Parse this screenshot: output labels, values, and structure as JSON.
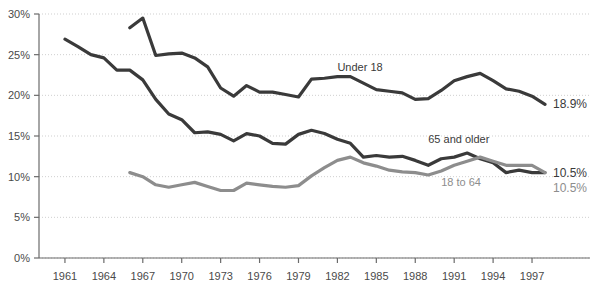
{
  "chart_data": {
    "type": "line",
    "title": "",
    "xlabel": "",
    "ylabel": "",
    "xlim": [
      1959,
      1998
    ],
    "ylim": [
      0,
      30
    ],
    "grid": true,
    "grid_style": "dotted-horizontal",
    "legend_position": "inline-annotations",
    "y_ticks": [
      "0%",
      "5%",
      "10%",
      "15%",
      "20%",
      "25%",
      "30%"
    ],
    "y_tick_values": [
      0,
      5,
      10,
      15,
      20,
      25,
      30
    ],
    "x_ticks": [
      "1961",
      "1964",
      "1967",
      "1970",
      "1973",
      "1976",
      "1979",
      "1982",
      "1985",
      "1988",
      "1991",
      "1994",
      "1997"
    ],
    "x_tick_values": [
      1961,
      1964,
      1967,
      1970,
      1973,
      1976,
      1979,
      1982,
      1985,
      1988,
      1991,
      1994,
      1997
    ],
    "series": [
      {
        "name": "Under 18",
        "label": "Under 18",
        "color": "#3a3a3a",
        "end_value_label": "18.9%",
        "end_value": 18.9,
        "x": [
          1966,
          1967,
          1968,
          1969,
          1970,
          1971,
          1972,
          1973,
          1974,
          1975,
          1976,
          1977,
          1978,
          1979,
          1980,
          1981,
          1982,
          1983,
          1984,
          1985,
          1986,
          1987,
          1988,
          1989,
          1990,
          1991,
          1992,
          1993,
          1994,
          1995,
          1996,
          1997,
          1998
        ],
        "values": [
          28.3,
          29.5,
          24.9,
          25.1,
          25.2,
          24.6,
          23.5,
          20.9,
          19.9,
          21.2,
          20.4,
          20.4,
          20.1,
          19.8,
          22.0,
          22.1,
          22.3,
          22.3,
          21.5,
          20.7,
          20.5,
          20.3,
          19.5,
          19.6,
          20.6,
          21.8,
          22.3,
          22.7,
          21.8,
          20.8,
          20.5,
          19.9,
          18.9
        ]
      },
      {
        "name": "65 and older",
        "label": "65 and older",
        "color": "#3a3a3a",
        "end_value_label": "10.5%",
        "end_value": 10.5,
        "x": [
          1961,
          1962,
          1963,
          1964,
          1965,
          1966,
          1967,
          1968,
          1969,
          1970,
          1971,
          1972,
          1973,
          1974,
          1975,
          1976,
          1977,
          1978,
          1979,
          1980,
          1981,
          1982,
          1983,
          1984,
          1985,
          1986,
          1987,
          1988,
          1989,
          1990,
          1991,
          1992,
          1993,
          1994,
          1995,
          1996,
          1997,
          1998
        ],
        "values": [
          26.9,
          26.0,
          25.0,
          24.6,
          23.1,
          23.1,
          21.9,
          19.5,
          17.7,
          17.0,
          15.4,
          15.5,
          15.2,
          14.4,
          15.3,
          15.0,
          14.1,
          14.0,
          15.2,
          15.7,
          15.3,
          14.6,
          14.1,
          12.4,
          12.6,
          12.4,
          12.5,
          12.0,
          11.4,
          12.2,
          12.4,
          12.9,
          12.2,
          11.7,
          10.5,
          10.8,
          10.5,
          10.5
        ]
      },
      {
        "name": "18 to 64",
        "label": "18 to 64",
        "color": "#8d8d8d",
        "end_value_label": "10.5%",
        "end_value": 10.5,
        "x": [
          1966,
          1967,
          1968,
          1969,
          1970,
          1971,
          1972,
          1973,
          1974,
          1975,
          1976,
          1977,
          1978,
          1979,
          1980,
          1981,
          1982,
          1983,
          1984,
          1985,
          1986,
          1987,
          1988,
          1989,
          1990,
          1991,
          1992,
          1993,
          1994,
          1995,
          1996,
          1997,
          1998
        ],
        "values": [
          10.5,
          10.0,
          9.0,
          8.7,
          9.0,
          9.3,
          8.8,
          8.3,
          8.3,
          9.2,
          9.0,
          8.8,
          8.7,
          8.9,
          10.1,
          11.1,
          12.0,
          12.4,
          11.7,
          11.3,
          10.8,
          10.6,
          10.5,
          10.2,
          10.7,
          11.4,
          11.9,
          12.4,
          11.9,
          11.4,
          11.4,
          11.4,
          10.5
        ]
      }
    ],
    "annotations": [
      {
        "text": "Under 18",
        "x": 1982,
        "y": 23.0
      },
      {
        "text": "65 and older",
        "x": 1989,
        "y": 14.2
      },
      {
        "text": "18 to 64",
        "x": 1990,
        "y": 8.9
      }
    ],
    "colors": {
      "series_dark": "#3a3a3a",
      "series_light": "#8d8d8d",
      "axis": "#6b6b6b",
      "gridline": "#cfcfcf",
      "text": "#4a4a4a",
      "background": "#ffffff"
    }
  }
}
